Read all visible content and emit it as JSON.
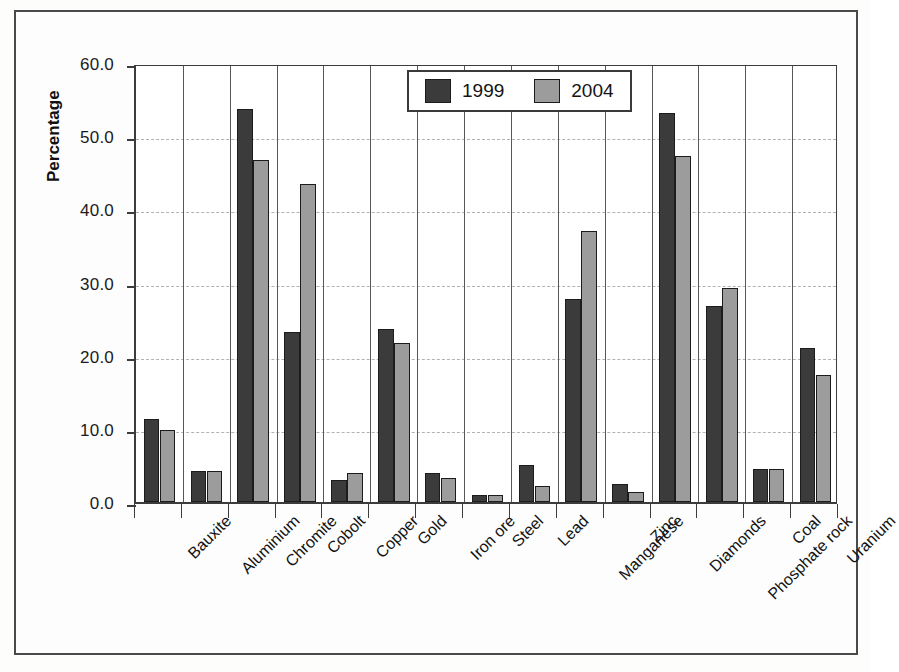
{
  "chart_data": {
    "type": "bar",
    "title": "",
    "xlabel": "",
    "ylabel": "Percentage",
    "ylim": [
      0,
      60
    ],
    "ytick_step": 10,
    "ytick_labels": [
      "0.0",
      "10.0",
      "20.0",
      "30.0",
      "40.0",
      "50.0",
      "60.0"
    ],
    "grid": "horizontal-dashed",
    "legend_position": "top-center",
    "categories": [
      "Bauxite",
      "Aluminium",
      "Chromite",
      "Cobolt",
      "Copper",
      "Gold",
      "Iron ore",
      "Steel",
      "Lead",
      "Manganese",
      "Zinc",
      "Diamonds",
      "Phosphate rock",
      "Coal",
      "Uranium"
    ],
    "series": [
      {
        "name": "1999",
        "color": "#3b3b3b",
        "values": [
          11.4,
          4.2,
          53.7,
          23.2,
          3.0,
          23.7,
          4.0,
          0.9,
          5.1,
          27.8,
          2.5,
          53.2,
          26.8,
          4.5,
          21.0
        ]
      },
      {
        "name": "2004",
        "color": "#9c9c9c",
        "values": [
          9.8,
          4.3,
          46.8,
          43.5,
          4.0,
          21.8,
          3.3,
          0.9,
          2.2,
          37.0,
          1.4,
          47.3,
          29.2,
          4.5,
          17.3
        ]
      }
    ]
  },
  "legend": {
    "items": [
      {
        "label": "1999",
        "swatch": "dark-gray-swatch"
      },
      {
        "label": "2004",
        "swatch": "light-gray-swatch"
      }
    ]
  },
  "axes": {
    "y_title": "Percentage"
  }
}
